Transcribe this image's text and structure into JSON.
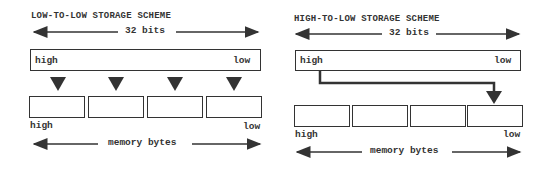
{
  "left_scheme": {
    "title": "LOW-TO-LOW STORAGE SCHEME",
    "width_label": "32 bits",
    "register_high": "high",
    "register_low": "low",
    "byte_count": 4,
    "bytes_high": "high",
    "bytes_low": "low",
    "memory_label": "memory bytes"
  },
  "right_scheme": {
    "title": "HIGH-TO-LOW STORAGE SCHEME",
    "width_label": "32 bits",
    "register_high": "high",
    "register_low": "low",
    "byte_count": 4,
    "bytes_high": "high",
    "bytes_low": "low",
    "memory_label": "memory bytes"
  }
}
